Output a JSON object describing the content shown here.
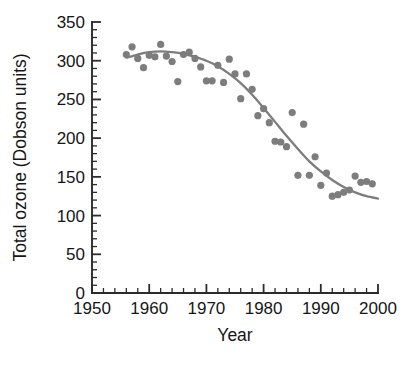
{
  "chart_data": {
    "type": "scatter",
    "title": "",
    "xlabel": "Year",
    "ylabel": "Total ozone (Dobson units)",
    "xlim": [
      1950,
      2000
    ],
    "ylim": [
      0,
      350
    ],
    "grid": false,
    "legend": null,
    "x_major_ticks": [
      1950,
      1960,
      1970,
      1980,
      1990,
      2000
    ],
    "x_major_tick_labels": [
      "1950",
      "1960",
      "1970",
      "1980",
      "1990",
      "2000"
    ],
    "x_minor_tick_step": 2,
    "y_major_ticks": [
      0,
      50,
      100,
      150,
      200,
      250,
      300,
      350
    ],
    "y_major_tick_labels": [
      "0",
      "50",
      "100",
      "150",
      "200",
      "250",
      "300",
      "350"
    ],
    "y_minor_tick_step": 10,
    "marker_color": "#7d7d7d",
    "line_color": "#7d7d7d",
    "axis_color": "#2b2b2b",
    "background_color": "#ffffff",
    "series": [
      {
        "name": "Observed total ozone",
        "type": "scatter",
        "x": [
          1956,
          1957,
          1958,
          1959,
          1960,
          1961,
          1962,
          1963,
          1964,
          1965,
          1966,
          1967,
          1968,
          1969,
          1970,
          1971,
          1972,
          1973,
          1974,
          1975,
          1976,
          1977,
          1978,
          1979,
          1980,
          1981,
          1982,
          1983,
          1984,
          1985,
          1986,
          1987,
          1988,
          1989,
          1990,
          1991,
          1992,
          1993,
          1994,
          1995,
          1996,
          1997,
          1998,
          1999
        ],
        "y": [
          308,
          318,
          303,
          291,
          307,
          305,
          321,
          306,
          299,
          273,
          308,
          311,
          303,
          292,
          274,
          274,
          294,
          272,
          302,
          283,
          251,
          283,
          263,
          229,
          238,
          220,
          196,
          195,
          189,
          233,
          152,
          218,
          152,
          176,
          139,
          155,
          125,
          127,
          130,
          133,
          151,
          143,
          144,
          141
        ]
      },
      {
        "name": "Fitted trend",
        "type": "line",
        "x": [
          1956,
          1958,
          1960,
          1962,
          1964,
          1966,
          1968,
          1970,
          1972,
          1974,
          1976,
          1978,
          1980,
          1982,
          1984,
          1986,
          1988,
          1990,
          1992,
          1994,
          1996,
          1998,
          2000
        ],
        "y": [
          304,
          308,
          311,
          312,
          311,
          309,
          305,
          300,
          293,
          283,
          271,
          256,
          239,
          221,
          203,
          186,
          170,
          157,
          146,
          137,
          130,
          125,
          122
        ]
      }
    ]
  }
}
